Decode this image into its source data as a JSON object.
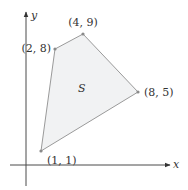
{
  "diagram": {
    "region_label": "S",
    "axes": {
      "x_label": "x",
      "y_label": "y"
    },
    "vertices": [
      {
        "x": 1,
        "y": 1,
        "label": "(1, 1)"
      },
      {
        "x": 2,
        "y": 8,
        "label": "(2, 8)"
      },
      {
        "x": 4,
        "y": 9,
        "label": "(4, 9)"
      },
      {
        "x": 8,
        "y": 5,
        "label": "(8, 5)"
      }
    ],
    "colors": {
      "region_fill": "#f1f2f3",
      "edge": "#9a9a9a",
      "axis": "#4a4a4a"
    }
  }
}
